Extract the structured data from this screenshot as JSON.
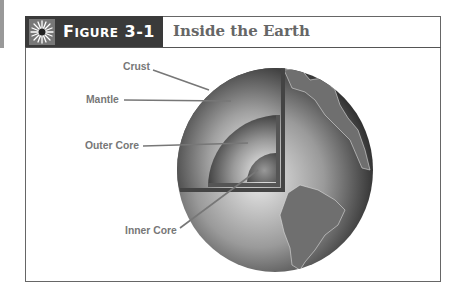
{
  "header": {
    "figure_label_prefix": "F",
    "figure_label_rest": "IGURE",
    "figure_number": "3-1",
    "title": "Inside the Earth",
    "icon": "star-burst-icon"
  },
  "diagram": {
    "labels": [
      {
        "id": "crust",
        "text": "Crust"
      },
      {
        "id": "mantle",
        "text": "Mantle"
      },
      {
        "id": "outer-core",
        "text": "Outer Core"
      },
      {
        "id": "inner-core",
        "text": "Inner Core"
      }
    ]
  }
}
